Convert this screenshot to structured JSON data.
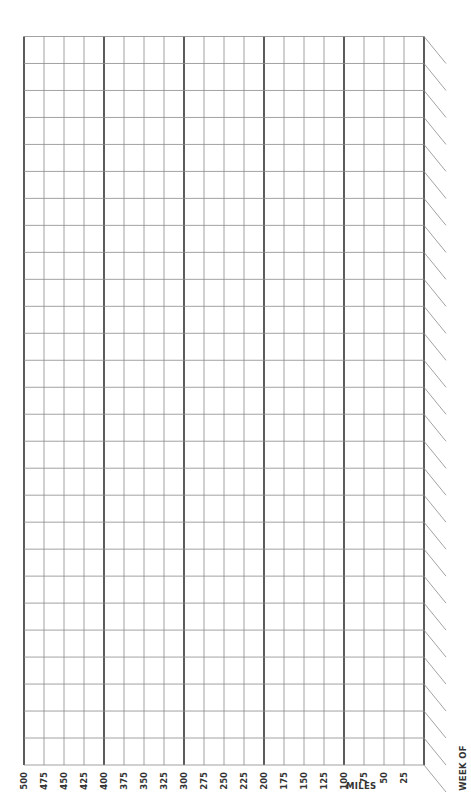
{
  "chart_data": {
    "type": "table",
    "title": "",
    "orientation": "rotated-90",
    "xlabel": "MILES",
    "ylabel": "WEEK OF",
    "x_ticks": [
      500,
      475,
      450,
      425,
      400,
      375,
      350,
      325,
      300,
      275,
      250,
      225,
      200,
      175,
      150,
      125,
      100,
      75,
      50,
      25
    ],
    "bold_ticks": [
      500,
      400,
      300,
      200,
      100,
      0
    ],
    "xlim": [
      500,
      0
    ],
    "rows": 27,
    "grid": true,
    "values": []
  },
  "axes": {
    "miles_label": "MILES",
    "week_label": "WEEK OF",
    "tick_labels": [
      "500",
      "475",
      "450",
      "425",
      "400",
      "375",
      "350",
      "325",
      "300",
      "275",
      "250",
      "225",
      "200",
      "175",
      "150",
      "125",
      "100",
      "75",
      "50",
      "25"
    ]
  },
  "colors": {
    "grid_thin": "#8a8a8a",
    "grid_bold": "#333333",
    "diagonal": "#8a8a8a",
    "text": "#333333"
  }
}
